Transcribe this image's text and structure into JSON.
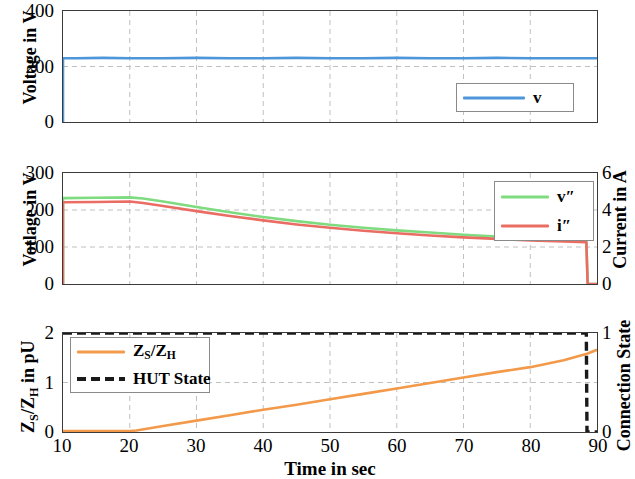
{
  "figure": {
    "width": 618,
    "height": 479,
    "xlabel": "Time in sec",
    "xticks": [
      "10",
      "20",
      "30",
      "40",
      "50",
      "60",
      "70",
      "80",
      "90"
    ]
  },
  "panels": {
    "top": {
      "ylabel": "Voltage in V",
      "yticks": [
        "0",
        "200",
        "400"
      ],
      "legend": [
        {
          "label": "v",
          "color": "#4d96d9",
          "style": "solid"
        }
      ]
    },
    "middle": {
      "ylabel": "Votlage in V",
      "yticks": [
        "0",
        "100",
        "200",
        "300"
      ],
      "ylabel_right": "Current in A",
      "yticks_right": [
        "0",
        "2",
        "4",
        "6"
      ],
      "legend": [
        {
          "label": "v″",
          "color": "#7fdb7f",
          "style": "solid"
        },
        {
          "label": "i″",
          "color": "#ea6d64",
          "style": "solid"
        }
      ]
    },
    "bottom": {
      "ylabel": "Z_S/Z_H in pU",
      "yticks": [
        "0",
        "1",
        "2"
      ],
      "ylabel_right": "Connection State",
      "yticks_right": [
        "0",
        "1"
      ],
      "legend": [
        {
          "label": "Z_S/Z_H",
          "color": "#f2994a",
          "style": "solid"
        },
        {
          "label": "HUT State",
          "color": "#1a1a1a",
          "style": "dashed"
        }
      ]
    }
  },
  "colors": {
    "blue": "#4d96d9",
    "green": "#7fdb7f",
    "red": "#ea6d64",
    "orange": "#f2994a",
    "black": "#1a1a1a",
    "grid": "#b9b9b9",
    "axis": "#3a3a3a"
  },
  "chart_data": [
    {
      "type": "line",
      "id": "top",
      "title": "",
      "xlabel": "",
      "ylabel": "Voltage in V",
      "xlim": [
        10,
        90
      ],
      "ylim": [
        0,
        400
      ],
      "xticks": [
        10,
        20,
        30,
        40,
        50,
        60,
        70,
        80,
        90
      ],
      "yticks": [
        0,
        200,
        400
      ],
      "grid": true,
      "legend": [
        "v"
      ],
      "legend_position": "lower right",
      "series": [
        {
          "name": "v",
          "color": "#4d96d9",
          "x": [
            10,
            10,
            12,
            16,
            20,
            25,
            30,
            35,
            40,
            45,
            50,
            55,
            60,
            65,
            70,
            75,
            80,
            85,
            88.5,
            90
          ],
          "values": [
            0,
            230,
            230,
            231,
            230,
            230,
            231,
            230,
            230,
            231,
            230,
            230,
            231,
            230,
            230,
            231,
            230,
            230,
            230,
            230
          ]
        }
      ]
    },
    {
      "type": "line",
      "id": "middle",
      "title": "",
      "xlabel": "",
      "ylabel": "Votlage in V",
      "ylabel_right": "Current in A",
      "xlim": [
        10,
        90
      ],
      "ylim": [
        0,
        300
      ],
      "ylim_right": [
        0,
        6
      ],
      "xticks": [
        10,
        20,
        30,
        40,
        50,
        60,
        70,
        80,
        90
      ],
      "yticks": [
        0,
        100,
        200,
        300
      ],
      "yticks_right": [
        0,
        2,
        4,
        6
      ],
      "grid": true,
      "legend": [
        "v″",
        "i″"
      ],
      "legend_position": "upper right",
      "series": [
        {
          "name": "v″",
          "color": "#7fdb7f",
          "axis": "left",
          "x": [
            10,
            10,
            15,
            20,
            22,
            25,
            30,
            35,
            40,
            45,
            50,
            55,
            60,
            65,
            70,
            75,
            80,
            85,
            88.4,
            88.6,
            90
          ],
          "values": [
            0,
            232,
            233,
            234,
            231,
            223,
            208,
            194,
            181,
            170,
            160,
            152,
            145,
            139,
            133,
            128,
            124,
            121,
            119,
            0,
            0
          ]
        },
        {
          "name": "i″",
          "color": "#ea6d64",
          "axis": "right",
          "x": [
            10,
            10,
            15,
            20,
            22,
            25,
            30,
            35,
            40,
            45,
            50,
            55,
            60,
            65,
            70,
            75,
            80,
            85,
            88.4,
            88.6,
            90
          ],
          "values": [
            0,
            4.42,
            4.43,
            4.46,
            4.38,
            4.22,
            3.94,
            3.68,
            3.44,
            3.22,
            3.04,
            2.88,
            2.74,
            2.62,
            2.52,
            2.44,
            2.36,
            2.3,
            2.26,
            0,
            0
          ]
        }
      ]
    },
    {
      "type": "line",
      "id": "bottom",
      "title": "",
      "xlabel": "Time in sec",
      "ylabel": "Z_S/Z_H in pU",
      "ylabel_right": "Connection State",
      "xlim": [
        10,
        90
      ],
      "ylim": [
        0,
        2
      ],
      "ylim_right": [
        0,
        1
      ],
      "xticks": [
        10,
        20,
        30,
        40,
        50,
        60,
        70,
        80,
        90
      ],
      "yticks": [
        0,
        1,
        2
      ],
      "yticks_right": [
        0,
        1
      ],
      "grid": true,
      "legend": [
        "Z_S/Z_H",
        "HUT State"
      ],
      "legend_position": "upper left",
      "series": [
        {
          "name": "Z_S/Z_H",
          "color": "#f2994a",
          "axis": "left",
          "style": "solid",
          "x": [
            10,
            15,
            20,
            21,
            25,
            30,
            35,
            40,
            45,
            50,
            55,
            60,
            65,
            70,
            75,
            80,
            85,
            88.5,
            90
          ],
          "values": [
            0.02,
            0.02,
            0.02,
            0.03,
            0.12,
            0.23,
            0.34,
            0.45,
            0.55,
            0.66,
            0.77,
            0.88,
            0.99,
            1.1,
            1.21,
            1.31,
            1.45,
            1.58,
            1.66
          ]
        },
        {
          "name": "HUT State",
          "color": "#1a1a1a",
          "axis": "right",
          "style": "dashed",
          "x": [
            10,
            20,
            30,
            40,
            50,
            60,
            70,
            80,
            88.4,
            88.5,
            90
          ],
          "values": [
            1,
            1,
            1,
            1,
            1,
            1,
            1,
            1,
            1,
            0,
            0
          ]
        }
      ]
    }
  ]
}
